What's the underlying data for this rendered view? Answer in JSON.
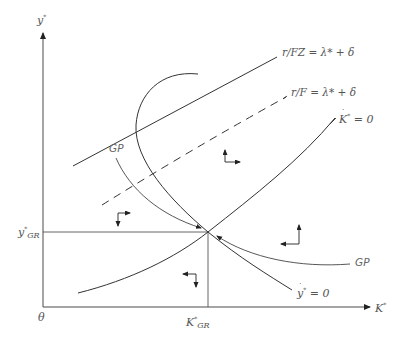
{
  "diagram": {
    "type": "phase-diagram",
    "axes": {
      "y_label": "y",
      "y_label_sup": "*",
      "x_label": "K",
      "x_label_sup": "*",
      "origin_label": "θ"
    },
    "equilibrium": {
      "y_label": "y",
      "y_label_sup": "*",
      "y_label_sub": "GR",
      "x_label": "K",
      "x_label_sup": "*",
      "x_label_sub": "GR"
    },
    "curves": {
      "r_fz": {
        "label": "r/FZ = λ* + δ",
        "style": "solid"
      },
      "r_f": {
        "label": "r/F = λ* + δ",
        "style": "dashed"
      },
      "kdot": {
        "label_var": "K",
        "label_sup": "*",
        "label_rest": " = 0",
        "style": "solid"
      },
      "ydot": {
        "label_var": "y",
        "label_sup": "*",
        "label_rest": " = 0",
        "style": "solid"
      },
      "gp_upper": {
        "label": "GP"
      },
      "gp_lower": {
        "label": "GP"
      }
    },
    "colors": {
      "line": "#3a3a3a",
      "axis": "#4a4a4a",
      "label": "#555555"
    }
  }
}
